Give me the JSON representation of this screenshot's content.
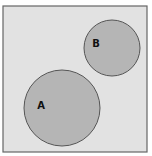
{
  "diagram": {
    "type": "venn",
    "universe": {
      "x": 3,
      "y": 6,
      "width": 144,
      "height": 146,
      "fill": "#e2e2e2",
      "stroke": "#666666"
    },
    "sets": [
      {
        "label": "A",
        "cx": 62,
        "cy": 108,
        "r": 38,
        "label_x": 41,
        "label_y": 109,
        "fill": "#b5b5b5",
        "stroke": "#555555"
      },
      {
        "label": "B",
        "cx": 112,
        "cy": 48,
        "r": 28,
        "label_x": 96,
        "label_y": 47,
        "fill": "#b5b5b5",
        "stroke": "#555555"
      }
    ],
    "relationship": "disjoint"
  }
}
